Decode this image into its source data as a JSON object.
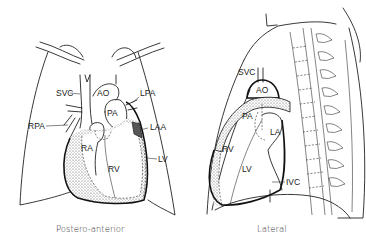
{
  "figure": {
    "panels": [
      {
        "id": "postero-anterior",
        "caption": "Postero-anterior",
        "labels": {
          "svc": "SVC",
          "ao": "AO",
          "lpa": "LPA",
          "pa": "PA",
          "rpa": "RPA",
          "laa": "LAA",
          "ra": "RA",
          "rv": "RV",
          "lv": "LV"
        }
      },
      {
        "id": "lateral",
        "caption": "Lateral",
        "labels": {
          "svc": "SVC",
          "ao": "AO",
          "pa": "PA",
          "la": "LA",
          "rv": "RV",
          "lv": "LV",
          "ivc": "IVC"
        }
      }
    ]
  },
  "colors": {
    "line": "#222222",
    "stipple": "#999999",
    "background": "#ffffff"
  }
}
